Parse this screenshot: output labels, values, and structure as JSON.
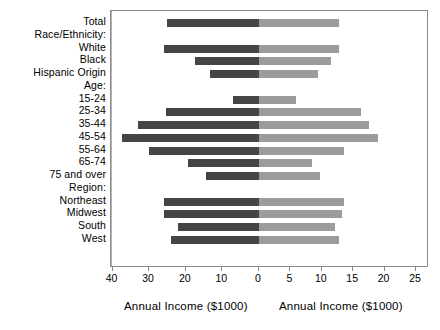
{
  "chart_data": {
    "type": "bar",
    "subtype": "diverging-paired-bar",
    "title": "",
    "categories": [
      "Total",
      "Race/Ethnicity:",
      "White",
      "Black",
      "Hispanic Origin",
      "Age:",
      "15-24",
      "25-34",
      "35-44",
      "45-54",
      "55-64",
      "65-74",
      "75 and over",
      "Region:",
      "Northeast",
      "Midwest",
      "South",
      "West"
    ],
    "group_headers": [
      "Race/Ethnicity:",
      "Age:",
      "Region:"
    ],
    "series": [
      {
        "name": "Left panel",
        "xlabel": "Annual Income ($1000)",
        "xlim": [
          40,
          0
        ],
        "direction": "left",
        "ticks": [
          40,
          30,
          20,
          10,
          0
        ],
        "color": "#454545",
        "values": {
          "Total": 25,
          "White": 26,
          "Black": 17.5,
          "Hispanic Origin": 13.5,
          "15-24": 7,
          "25-34": 25.5,
          "35-44": 33,
          "45-54": 37.5,
          "55-64": 30,
          "65-74": 19.5,
          "75 and over": 14.5,
          "Northeast": 26,
          "Midwest": 26,
          "South": 22,
          "West": 24
        }
      },
      {
        "name": "Right panel",
        "xlabel": "Annual Income ($1000)",
        "xlim": [
          0,
          25
        ],
        "direction": "right",
        "ticks": [
          0,
          5,
          10,
          15,
          20,
          25
        ],
        "color": "#9c9c9c",
        "values": {
          "Total": 12.8,
          "White": 12.7,
          "Black": 11.4,
          "Hispanic Origin": 9.4,
          "15-24": 5.9,
          "25-34": 16.2,
          "35-44": 17.5,
          "45-54": 19,
          "55-64": 13.5,
          "65-74": 8.5,
          "75 and over": 9.7,
          "Northeast": 13.5,
          "Midwest": 13.2,
          "South": 12.1,
          "West": 12.7
        }
      }
    ],
    "grid": false,
    "legend": "none",
    "axis_left_title": "Annual Income ($1000)",
    "axis_right_title": "Annual Income ($1000)"
  }
}
